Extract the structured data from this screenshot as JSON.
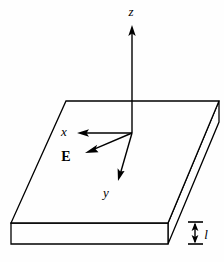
{
  "figure": {
    "background_color": "#fefefe",
    "line_color": "#000000",
    "width": 224,
    "height": 262
  },
  "axes": {
    "z": {
      "label": "z",
      "label_x": 131,
      "label_y": 16,
      "line": {
        "x1": 132,
        "y1": 133,
        "x2": 132,
        "y2": 30
      },
      "arrow_tip": {
        "x": 132,
        "y": 25
      },
      "direction": "up"
    },
    "x": {
      "label": "x",
      "label_x": 64,
      "label_y": 136,
      "line": {
        "x1": 132,
        "y1": 133,
        "x2": 83,
        "y2": 133
      },
      "arrow_tip": {
        "x": 77,
        "y": 133
      },
      "direction": "left"
    },
    "y": {
      "label": "y",
      "label_x": 106,
      "label_y": 197,
      "line": {
        "x1": 132,
        "y1": 133,
        "x2": 120,
        "y2": 174
      },
      "arrow_tip": {
        "x": 118,
        "y": 181
      },
      "direction": "down-right-front"
    }
  },
  "field_vector": {
    "label": "E",
    "label_x": 66,
    "label_y": 161,
    "line": {
      "x1": 132,
      "y1": 133,
      "x2": 92,
      "y2": 150
    },
    "arrow_tip": {
      "x": 85,
      "y": 153
    }
  },
  "origin": {
    "x": 132,
    "y": 133
  },
  "slab": {
    "top_face": {
      "points": "66,101 219,101 168,223 11,223",
      "corners": {
        "back_left": {
          "x": 66,
          "y": 101
        },
        "back_right": {
          "x": 219,
          "y": 101
        },
        "front_right": {
          "x": 168,
          "y": 223
        },
        "front_left": {
          "x": 11,
          "y": 223
        }
      }
    },
    "front_face": {
      "points": "11,223 168,223 168,244 11,244"
    },
    "right_face": {
      "points": "168,223 219,101 219,122 168,244"
    }
  },
  "thickness_dimension": {
    "label": "l",
    "label_x": 205,
    "label_y": 239,
    "top_tick": {
      "x1": 188,
      "y1": 222,
      "x2": 203,
      "y2": 222
    },
    "bottom_tick": {
      "x1": 188,
      "y1": 244,
      "x2": 203,
      "y2": 244
    },
    "arrow_line": {
      "x1": 195,
      "y1": 224,
      "x2": 195,
      "y2": 242
    },
    "arrow_tip_top": {
      "x": 195,
      "y": 223
    },
    "arrow_tip_bottom": {
      "x": 195,
      "y": 243
    }
  }
}
